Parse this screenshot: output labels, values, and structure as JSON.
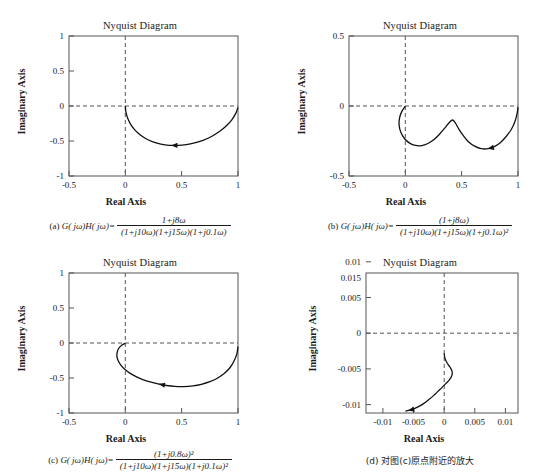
{
  "figure": {
    "panels": [
      {
        "id": "a",
        "title": "Nyquist Diagram",
        "xlabel": "Real Axis",
        "ylabel": "Imaginary Axis",
        "xticks": [
          "-0.5",
          "0",
          "0.5",
          "1"
        ],
        "xtick_values": [
          -0.5,
          0,
          0.5,
          1
        ],
        "yticks": [
          "-1",
          "-0.5",
          "0",
          "0.5",
          "1"
        ],
        "ytick_values": [
          -1,
          -0.5,
          0,
          0.5,
          1
        ],
        "xlim": [
          -0.5,
          1
        ],
        "ylim": [
          -1,
          1
        ],
        "caption_label": "(a)",
        "caption_lead": "G( jω)H( jω)=",
        "numerator": "1+j8ω",
        "denominator": "(1+j10ω)(1+j15ω)(1+j0.1ω)"
      },
      {
        "id": "b",
        "title": "Nyquist Diagram",
        "xlabel": "Real Axis",
        "ylabel": "Imaginary Axis",
        "xticks": [
          "-0.5",
          "0",
          "0.5",
          "1"
        ],
        "xtick_values": [
          -0.5,
          0,
          0.5,
          1
        ],
        "yticks": [
          "-0.5",
          "0",
          "0.5"
        ],
        "ytick_values": [
          -0.5,
          0,
          0.5
        ],
        "xlim": [
          -0.5,
          1
        ],
        "ylim": [
          -0.5,
          0.5
        ],
        "caption_label": "(b)",
        "caption_lead": "G( jω)H( jω)=",
        "numerator": "(1+j8ω)",
        "denominator": "(1+j10ω)(1+j15ω)(1+j0.1ω)²"
      },
      {
        "id": "c",
        "title": "Nyquist Diagram",
        "xlabel": "Real Axis",
        "ylabel": "Imaginary Axis",
        "xticks": [
          "-0.5",
          "0",
          "0.5",
          "1"
        ],
        "xtick_values": [
          -0.5,
          0,
          0.5,
          1
        ],
        "yticks": [
          "-1",
          "-0.5",
          "0",
          "0.5",
          "1"
        ],
        "ytick_values": [
          -1,
          -0.5,
          0,
          0.5,
          1
        ],
        "xlim": [
          -0.5,
          1
        ],
        "ylim": [
          -1,
          1
        ],
        "caption_label": "(c)",
        "caption_lead": "G( jω)H( jω)=",
        "numerator": "(1+j0.8ω)²",
        "denominator": "(1+j10ω)(1+j15ω)(1+j0.1ω)²"
      },
      {
        "id": "d",
        "title": "Nyquist Diagram",
        "xlabel": "Real Axis",
        "ylabel": "Imaginary Axis",
        "xticks": [
          "-0.01",
          "-0.005",
          "0",
          "0.005",
          "0.01"
        ],
        "xtick_values": [
          -0.01,
          -0.005,
          0,
          0.005,
          0.01
        ],
        "yticks": [
          "-0.01",
          "-0.005",
          "0",
          "0.005",
          "0.01",
          "0.015"
        ],
        "ytick_values": [
          -0.01,
          -0.005,
          0,
          0.005,
          0.01,
          0.015
        ],
        "xlim": [
          -0.0125,
          0.0118
        ],
        "ylim": [
          -0.0128,
          0.017
        ],
        "caption_label": "(d)",
        "caption_text": "对图(c)原点附近的放大"
      }
    ]
  },
  "chart_data": [
    {
      "type": "line",
      "panel": "a",
      "title": "Nyquist Diagram",
      "xlabel": "Real Axis",
      "ylabel": "Imaginary Axis",
      "xlim": [
        -0.5,
        1
      ],
      "ylim": [
        -1,
        1
      ],
      "xticks": [
        -0.5,
        0,
        0.5,
        1
      ],
      "yticks": [
        -1,
        -0.5,
        0,
        0.5,
        1
      ],
      "grid": false,
      "legend": "none",
      "annotations": [
        "arrow marker at (0.50,-0.56) pointing left"
      ],
      "series": [
        {
          "name": "Nyquist locus",
          "points": [
            [
              0.0,
              0.0
            ],
            [
              0.005,
              -0.085
            ],
            [
              0.02,
              -0.17
            ],
            [
              0.045,
              -0.255
            ],
            [
              0.08,
              -0.335
            ],
            [
              0.125,
              -0.405
            ],
            [
              0.18,
              -0.465
            ],
            [
              0.245,
              -0.512
            ],
            [
              0.315,
              -0.545
            ],
            [
              0.39,
              -0.562
            ],
            [
              0.465,
              -0.562
            ],
            [
              0.54,
              -0.551
            ],
            [
              0.615,
              -0.527
            ],
            [
              0.69,
              -0.49
            ],
            [
              0.765,
              -0.435
            ],
            [
              0.835,
              -0.365
            ],
            [
              0.895,
              -0.285
            ],
            [
              0.945,
              -0.197
            ],
            [
              0.98,
              -0.105
            ],
            [
              1.0,
              -0.02
            ]
          ]
        }
      ]
    },
    {
      "type": "line",
      "panel": "b",
      "title": "Nyquist Diagram",
      "xlabel": "Real Axis",
      "ylabel": "Imaginary Axis",
      "xlim": [
        -0.5,
        1
      ],
      "ylim": [
        -0.5,
        0.5
      ],
      "xticks": [
        -0.5,
        0,
        0.5,
        1
      ],
      "yticks": [
        -0.5,
        0,
        0.5
      ],
      "grid": false,
      "legend": "none",
      "annotations": [
        "arrow marker at (0.73,-0.30) pointing left"
      ],
      "series": [
        {
          "name": "Nyquist locus",
          "points": [
            [
              0.0,
              0.0
            ],
            [
              -0.032,
              -0.04
            ],
            [
              -0.052,
              -0.088
            ],
            [
              -0.055,
              -0.138
            ],
            [
              -0.04,
              -0.188
            ],
            [
              -0.008,
              -0.232
            ],
            [
              0.038,
              -0.265
            ],
            [
              0.09,
              -0.282
            ],
            [
              0.145,
              -0.283
            ],
            [
              0.2,
              -0.268
            ],
            [
              0.255,
              -0.24
            ],
            [
              0.305,
              -0.2
            ],
            [
              0.35,
              -0.158
            ],
            [
              0.39,
              -0.118
            ],
            [
              0.42,
              -0.1
            ],
            [
              0.445,
              -0.122
            ],
            [
              0.475,
              -0.165
            ],
            [
              0.515,
              -0.212
            ],
            [
              0.56,
              -0.255
            ],
            [
              0.615,
              -0.287
            ],
            [
              0.675,
              -0.305
            ],
            [
              0.735,
              -0.305
            ],
            [
              0.79,
              -0.29
            ],
            [
              0.845,
              -0.26
            ],
            [
              0.895,
              -0.218
            ],
            [
              0.94,
              -0.168
            ],
            [
              0.972,
              -0.112
            ],
            [
              0.992,
              -0.055
            ],
            [
              1.0,
              -0.008
            ]
          ]
        }
      ]
    },
    {
      "type": "line",
      "panel": "c",
      "title": "Nyquist Diagram",
      "xlabel": "Real Axis",
      "ylabel": "Imaginary Axis",
      "xlim": [
        -0.5,
        1
      ],
      "ylim": [
        -1,
        1
      ],
      "xticks": [
        -0.5,
        0,
        0.5,
        1
      ],
      "yticks": [
        -1,
        -0.5,
        0,
        0.5,
        1
      ],
      "grid": false,
      "legend": "none",
      "annotations": [
        "arrow marker at (0.42,-0.63) pointing left"
      ],
      "series": [
        {
          "name": "Nyquist locus",
          "points": [
            [
              0.0,
              -0.005
            ],
            [
              -0.03,
              -0.03
            ],
            [
              -0.058,
              -0.075
            ],
            [
              -0.072,
              -0.13
            ],
            [
              -0.075,
              -0.19
            ],
            [
              -0.063,
              -0.253
            ],
            [
              -0.04,
              -0.315
            ],
            [
              -0.005,
              -0.375
            ],
            [
              0.04,
              -0.43
            ],
            [
              0.095,
              -0.48
            ],
            [
              0.155,
              -0.522
            ],
            [
              0.22,
              -0.557
            ],
            [
              0.29,
              -0.585
            ],
            [
              0.365,
              -0.607
            ],
            [
              0.44,
              -0.62
            ],
            [
              0.52,
              -0.622
            ],
            [
              0.6,
              -0.612
            ],
            [
              0.675,
              -0.59
            ],
            [
              0.75,
              -0.553
            ],
            [
              0.82,
              -0.5
            ],
            [
              0.88,
              -0.432
            ],
            [
              0.93,
              -0.35
            ],
            [
              0.965,
              -0.258
            ],
            [
              0.99,
              -0.155
            ],
            [
              1.0,
              -0.05
            ]
          ]
        }
      ]
    },
    {
      "type": "line",
      "panel": "d",
      "title": "Nyquist Diagram",
      "xlabel": "Real Axis",
      "ylabel": "Imaginary Axis",
      "xlim": [
        -0.0125,
        0.0118
      ],
      "ylim": [
        -0.0128,
        0.017
      ],
      "xticks": [
        -0.01,
        -0.005,
        0,
        0.005,
        0.01
      ],
      "yticks": [
        -0.01,
        -0.005,
        0,
        0.005,
        0.01,
        0.015
      ],
      "grid": false,
      "legend": "none",
      "annotations": [
        "arrow marker at (-0.0055,-0.0122) pointing left"
      ],
      "series": [
        {
          "name": "Nyquist locus (zoom near origin)",
          "points": [
            [
              -0.0062,
              -0.0124
            ],
            [
              -0.0052,
              -0.0121
            ],
            [
              -0.0042,
              -0.0115
            ],
            [
              -0.0033,
              -0.0108
            ],
            [
              -0.0025,
              -0.01
            ],
            [
              -0.0017,
              -0.0091
            ],
            [
              -0.001,
              -0.0082
            ],
            [
              -0.0003,
              -0.0073
            ],
            [
              0.0003,
              -0.0065
            ],
            [
              0.0008,
              -0.0058
            ],
            [
              0.00115,
              -0.0051
            ],
            [
              0.00128,
              -0.0045
            ],
            [
              0.00125,
              -0.0039
            ],
            [
              0.00105,
              -0.0033
            ],
            [
              0.00075,
              -0.0027
            ],
            [
              0.00045,
              -0.0021
            ],
            [
              0.00022,
              -0.0015
            ],
            [
              8e-05,
              -0.0009
            ],
            [
              2e-05,
              -0.0004
            ],
            [
              0.0,
              -0.0001
            ]
          ]
        }
      ]
    }
  ]
}
